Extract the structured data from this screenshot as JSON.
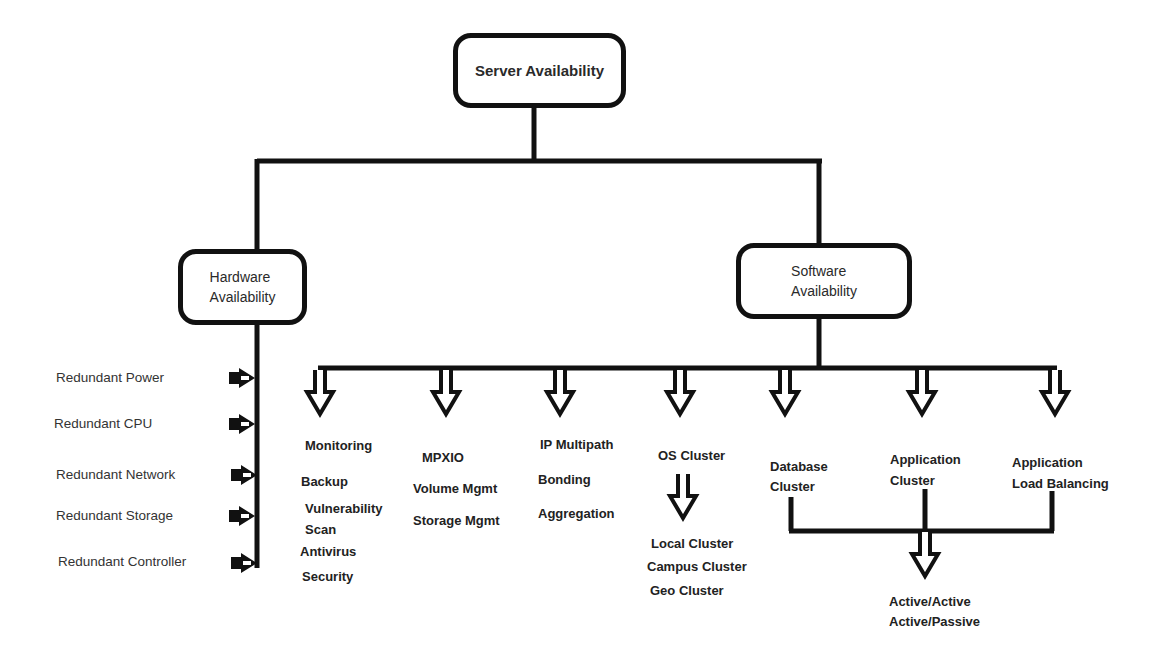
{
  "diagram": {
    "root": {
      "label": "Server Availability"
    },
    "hardware": {
      "label_line1": "Hardware",
      "label_line2": "Availability",
      "items": [
        "Redundant Power",
        "Redundant CPU",
        "Redundant Network",
        "Redundant Storage",
        "Redundant Controller"
      ]
    },
    "software": {
      "label_line1": "Software",
      "label_line2": "Availability",
      "groups": [
        {
          "title": "Monitoring",
          "items": [
            "Backup",
            "Vulnerability",
            "Scan",
            "Antivirus",
            "Security"
          ]
        },
        {
          "title": "MPXIO",
          "items": [
            "Volume Mgmt",
            "Storage Mgmt"
          ]
        },
        {
          "title": "IP Multipath",
          "items": [
            "Bonding",
            "Aggregation"
          ]
        },
        {
          "title": "OS Cluster",
          "items": [
            "Local Cluster",
            "Campus Cluster",
            "Geo Cluster"
          ]
        },
        {
          "title_line1": "Database",
          "title_line2": "Cluster"
        },
        {
          "title_line1": "Application",
          "title_line2": "Cluster"
        },
        {
          "title_line1": "Application",
          "title_line2": "Load Balancing"
        }
      ],
      "cluster_modes": [
        "Active/Active",
        "Active/Passive"
      ]
    }
  }
}
